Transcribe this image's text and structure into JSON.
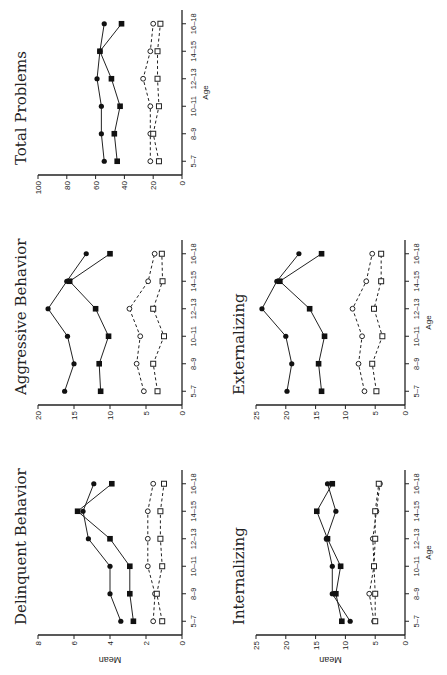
{
  "figure": {
    "orientation": "rotated-90-ccw",
    "y_axis_label": "Mean",
    "x_axis_label": "Age",
    "age_groups": [
      "5–7",
      "8–9",
      "10–11",
      "12–13",
      "14–15",
      "16–18"
    ]
  },
  "chart_data": [
    {
      "type": "line",
      "title": "Delinquent Behavior",
      "xlabel": "Age",
      "ylabel": "Mean",
      "ylim": [
        0,
        8
      ],
      "yticks": [
        0,
        2,
        4,
        6,
        8
      ],
      "categories": [
        "5–7",
        "8–9",
        "10–11",
        "12–13",
        "14–15",
        "16–18"
      ],
      "series": [
        {
          "name": "filled-circle-solid",
          "values": [
            3.4,
            4.0,
            4.0,
            5.2,
            5.5,
            4.9
          ]
        },
        {
          "name": "filled-square-solid",
          "values": [
            2.7,
            2.9,
            2.9,
            4.0,
            5.8,
            3.9
          ]
        },
        {
          "name": "open-circle-dashed",
          "values": [
            1.6,
            1.5,
            1.9,
            1.9,
            1.9,
            1.6
          ]
        },
        {
          "name": "open-square-dashed",
          "values": [
            1.1,
            1.4,
            1.1,
            1.2,
            1.2,
            1.0
          ]
        }
      ]
    },
    {
      "type": "line",
      "title": "Aggressive Behavior",
      "xlabel": "Age",
      "ylabel": "Mean",
      "ylim": [
        0,
        20
      ],
      "yticks": [
        0,
        5,
        10,
        15,
        20
      ],
      "categories": [
        "5–7",
        "8–9",
        "10–11",
        "12–13",
        "14–15",
        "16–18"
      ],
      "series": [
        {
          "name": "filled-circle-solid",
          "values": [
            16.3,
            15.0,
            15.9,
            18.6,
            16.0,
            13.3
          ]
        },
        {
          "name": "filled-square-solid",
          "values": [
            11.3,
            11.5,
            10.2,
            12.0,
            15.6,
            10.0
          ]
        },
        {
          "name": "open-circle-dashed",
          "values": [
            5.3,
            6.3,
            5.8,
            7.3,
            4.7,
            3.8
          ]
        },
        {
          "name": "open-square-dashed",
          "values": [
            3.4,
            4.0,
            2.5,
            4.0,
            2.7,
            2.8
          ]
        }
      ]
    },
    {
      "type": "line",
      "title": "Total Problems",
      "xlabel": "Age",
      "ylabel": "Mean",
      "ylim": [
        0,
        100
      ],
      "yticks": [
        0,
        20,
        40,
        60,
        80,
        100
      ],
      "categories": [
        "5–7",
        "8–9",
        "10–11",
        "12–13",
        "14–15",
        "16–18"
      ],
      "series": [
        {
          "name": "filled-circle-solid",
          "values": [
            54,
            56,
            56,
            59,
            57,
            54
          ]
        },
        {
          "name": "filled-square-solid",
          "values": [
            45,
            47,
            43,
            49,
            57,
            42
          ]
        },
        {
          "name": "open-circle-dashed",
          "values": [
            22,
            22,
            22,
            27,
            22,
            20
          ]
        },
        {
          "name": "open-square-dashed",
          "values": [
            16,
            20,
            16,
            17,
            17,
            15
          ]
        }
      ]
    },
    {
      "type": "line",
      "title": "Internalizing",
      "xlabel": "Age",
      "ylabel": "Mean",
      "ylim": [
        0,
        25
      ],
      "yticks": [
        0,
        5,
        10,
        15,
        20,
        25
      ],
      "categories": [
        "5–7",
        "8–9",
        "10–11",
        "12–13",
        "14–15",
        "16–18"
      ],
      "series": [
        {
          "name": "filled-circle-solid",
          "values": [
            9.2,
            12.2,
            12.2,
            13.2,
            11.6,
            13.0
          ]
        },
        {
          "name": "filled-square-solid",
          "values": [
            10.6,
            11.6,
            10.8,
            13.0,
            14.8,
            12.2
          ]
        },
        {
          "name": "open-circle-dashed",
          "values": [
            5.2,
            6.0,
            5.2,
            5.4,
            4.8,
            4.2
          ]
        },
        {
          "name": "open-square-dashed",
          "values": [
            5.0,
            5.0,
            5.2,
            5.0,
            5.0,
            4.4
          ]
        }
      ]
    },
    {
      "type": "line",
      "title": "Externalizing",
      "xlabel": "Age",
      "ylabel": "Mean",
      "ylim": [
        0,
        25
      ],
      "yticks": [
        0,
        5,
        10,
        15,
        20,
        25
      ],
      "categories": [
        "5–7",
        "8–9",
        "10–11",
        "12–13",
        "14–15",
        "16–18"
      ],
      "series": [
        {
          "name": "filled-circle-solid",
          "values": [
            19.8,
            19.0,
            20.0,
            24.0,
            21.5,
            17.8
          ]
        },
        {
          "name": "filled-square-solid",
          "values": [
            14.0,
            14.5,
            13.5,
            16.0,
            21.0,
            14.0
          ]
        },
        {
          "name": "open-circle-dashed",
          "values": [
            6.8,
            7.8,
            7.2,
            8.8,
            6.5,
            5.5
          ]
        },
        {
          "name": "open-square-dashed",
          "values": [
            4.8,
            5.5,
            3.8,
            5.2,
            4.0,
            4.0
          ]
        }
      ]
    }
  ]
}
